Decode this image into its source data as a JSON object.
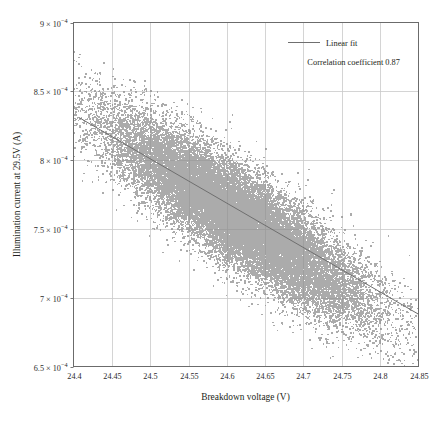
{
  "chart_data": {
    "type": "scatter",
    "title": "",
    "xlabel": "Breakdown voltage (V)",
    "ylabel": "Illumination current at 29.5V (A)",
    "xlim": [
      24.4,
      24.85
    ],
    "ylim": [
      0.00065,
      0.0009
    ],
    "grid": true,
    "xticks": [
      24.4,
      24.45,
      24.5,
      24.55,
      24.6,
      24.65,
      24.7,
      24.75,
      24.8,
      24.85
    ],
    "xtick_labels": [
      "24.4",
      "24.45",
      "24.5",
      "24.55",
      "24.6",
      "24.65",
      "24.7",
      "24.75",
      "24.8",
      "24.85"
    ],
    "yticks": [
      0.00065,
      0.0007,
      0.00075,
      0.0008,
      0.00085,
      0.0009
    ],
    "ytick_labels": [
      {
        "mantissa": "6.5 × 10",
        "exponent": "−4"
      },
      {
        "mantissa": "7 × 10",
        "exponent": "−4"
      },
      {
        "mantissa": "7.5 × 10",
        "exponent": "−4"
      },
      {
        "mantissa": "8 × 10",
        "exponent": "−4"
      },
      {
        "mantissa": "8.5 × 10",
        "exponent": "−4"
      },
      {
        "mantissa": "9 × 10",
        "exponent": "−4"
      }
    ],
    "series": [
      {
        "name": "Measured devices",
        "type": "scatter",
        "marker": "square",
        "marker_size": 1.6,
        "color": "#8a8a8a",
        "n_points": 26000,
        "x_center": 24.615,
        "x_spread": 0.083,
        "y_center": 0.0007585,
        "y_spread": 3.55e-05,
        "correlation": -0.87
      },
      {
        "name": "Linear fit",
        "type": "line",
        "color": "#6f6f6f",
        "x0": 24.407,
        "y0": 0.000831,
        "x1": 24.85,
        "y1": 0.000688
      }
    ],
    "legend": {
      "position": "upper-right",
      "entries": [
        {
          "label": "Linear fit",
          "marker": "line",
          "color": "#6f6f6f"
        }
      ],
      "annotation": "Correlation coefficient 0.87"
    },
    "correlation_coefficient": 0.87
  },
  "colors": {
    "point": "#8a8a8a",
    "fit_line": "#6f6f6f",
    "grid": "#c9c9c9",
    "frame": "#6b6b6b",
    "text": "#231f20",
    "background": "#ffffff"
  }
}
